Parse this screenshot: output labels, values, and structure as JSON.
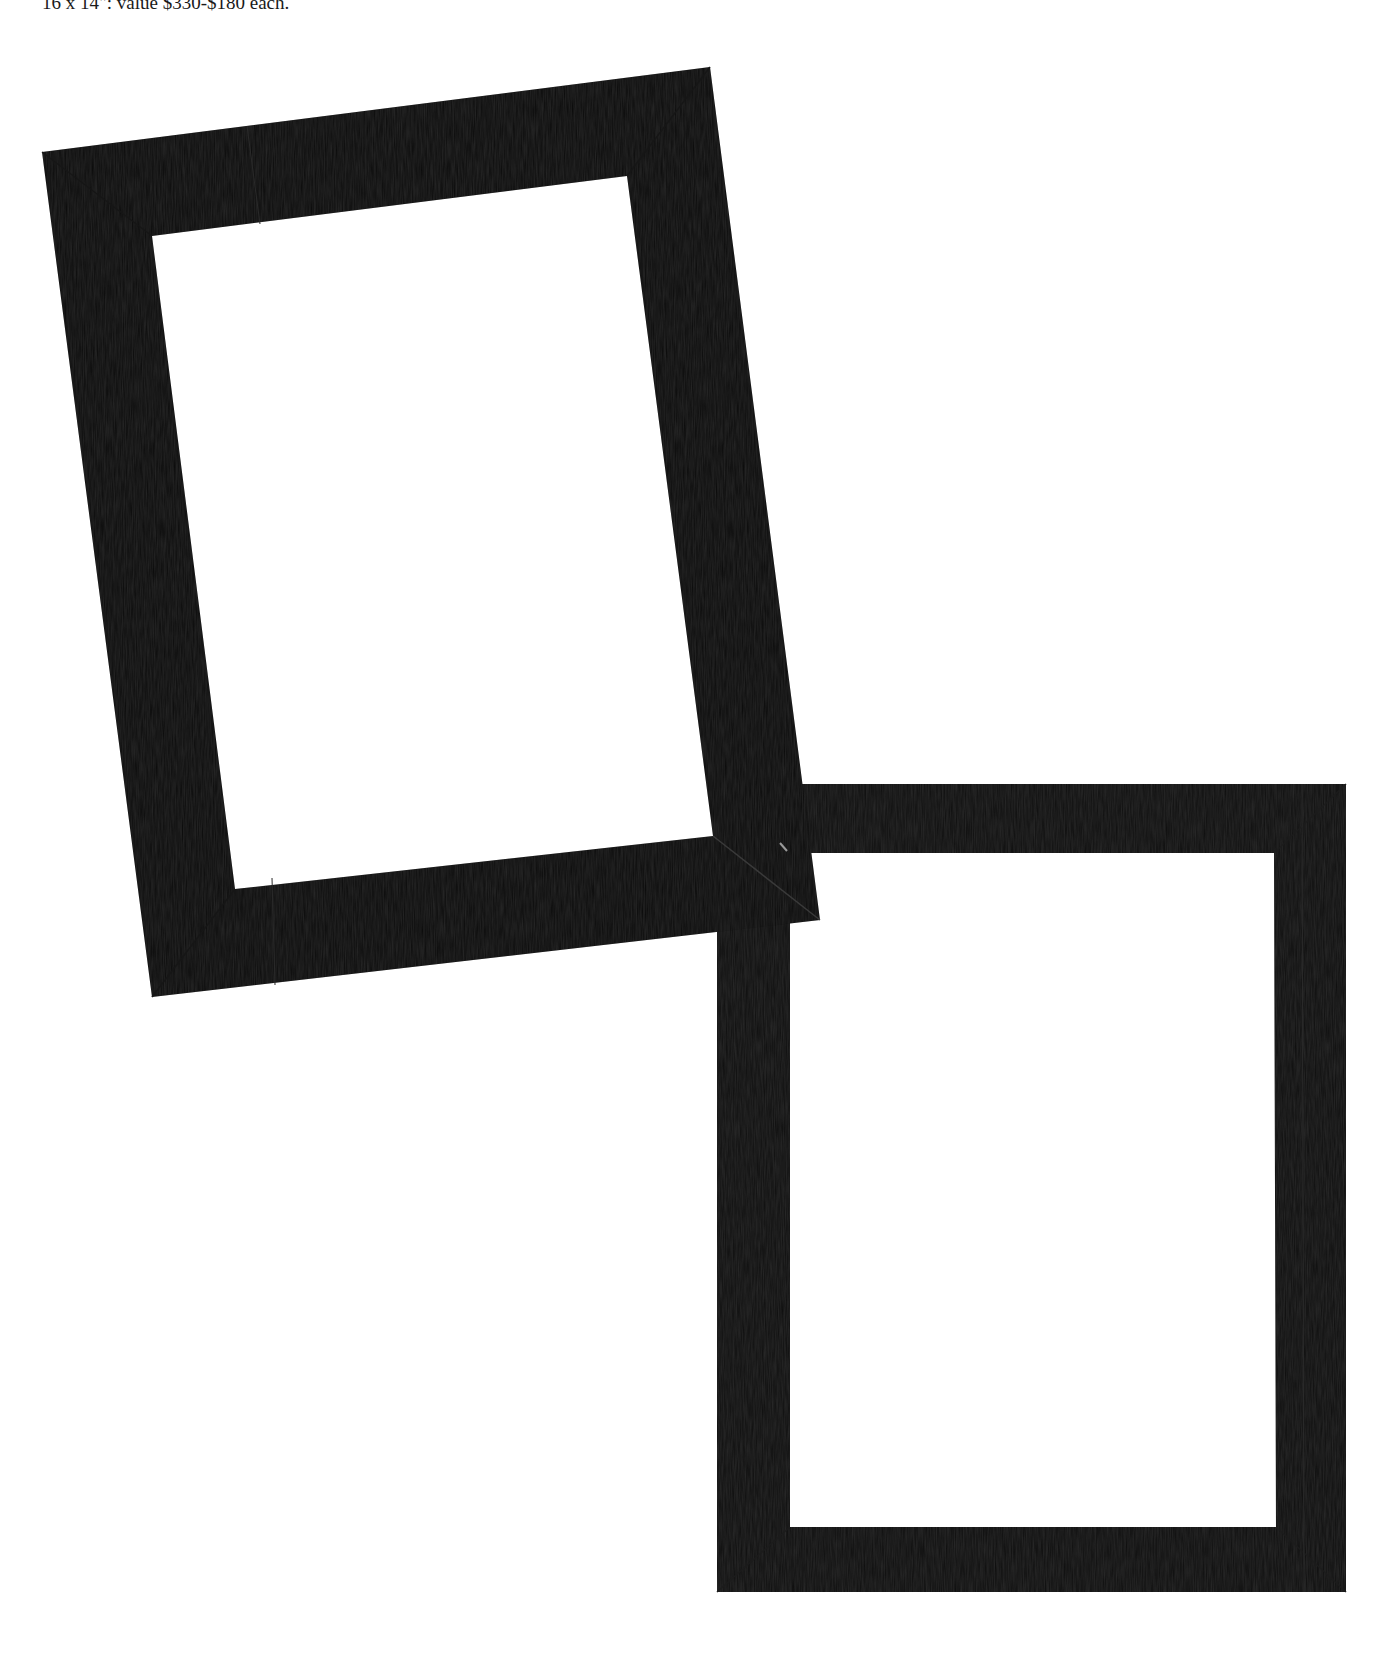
{
  "caption": {
    "text": "16 x 14\": value $330-$180 each."
  },
  "colors": {
    "background": "#ffffff",
    "frame_dark": "#0b0b0b",
    "frame_mid": "#161616",
    "frame_seam": "#2a2a2a"
  },
  "frames": [
    {
      "name": "frame-1",
      "description": "tilted black picture frame",
      "outer": [
        [
          42,
          152
        ],
        [
          710,
          67
        ],
        [
          820,
          920
        ],
        [
          152,
          997
        ]
      ],
      "inner": [
        [
          152,
          236
        ],
        [
          627,
          176
        ],
        [
          713,
          836
        ],
        [
          235,
          889
        ]
      ]
    },
    {
      "name": "frame-2",
      "description": "upright black picture frame",
      "outer": [
        [
          717,
          784
        ],
        [
          1346,
          784
        ],
        [
          1346,
          1592
        ],
        [
          717,
          1592
        ]
      ],
      "inner": [
        [
          790,
          853
        ],
        [
          1274,
          853
        ],
        [
          1276,
          1527
        ],
        [
          790,
          1527
        ]
      ]
    }
  ]
}
